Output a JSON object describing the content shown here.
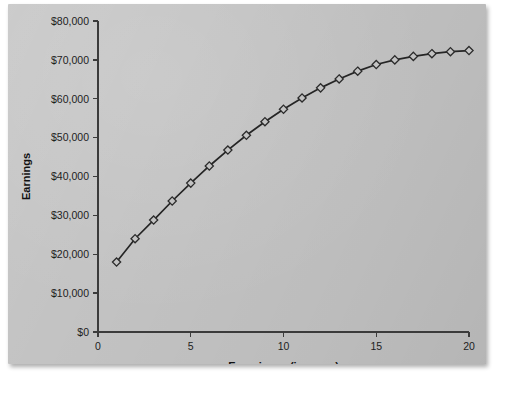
{
  "figure": {
    "background_color": "#c3c3c3",
    "page_color": "#ffffff",
    "line_color": "#252525",
    "marker_shape": "diamond"
  },
  "chart_data": {
    "type": "line",
    "title": "",
    "xlabel": "Experience (in years)",
    "ylabel": "Earnings",
    "xlim": [
      0,
      20
    ],
    "ylim": [
      0,
      80000
    ],
    "grid": false,
    "legend": "none",
    "x_tick_labels": [
      "0",
      "5",
      "10",
      "15",
      "20"
    ],
    "x_ticks": [
      0,
      5,
      10,
      15,
      20
    ],
    "y_tick_labels": [
      "$0",
      "$10,000",
      "$20,000",
      "$30,000",
      "$40,000",
      "$50,000",
      "$60,000",
      "$70,000",
      "$80,000"
    ],
    "y_ticks": [
      0,
      10000,
      20000,
      30000,
      40000,
      50000,
      60000,
      70000,
      80000
    ],
    "series": [
      {
        "name": "Earnings by experience",
        "marker": "diamond",
        "x": [
          1,
          2,
          3,
          4,
          5,
          6,
          7,
          8,
          9,
          10,
          11,
          12,
          13,
          14,
          15,
          16,
          17,
          18,
          19,
          20
        ],
        "values": [
          18000,
          24000,
          28800,
          33700,
          38300,
          42700,
          46800,
          50600,
          54100,
          57300,
          60200,
          62800,
          65100,
          67100,
          68800,
          70000,
          70900,
          71600,
          72100,
          72400
        ]
      }
    ]
  }
}
